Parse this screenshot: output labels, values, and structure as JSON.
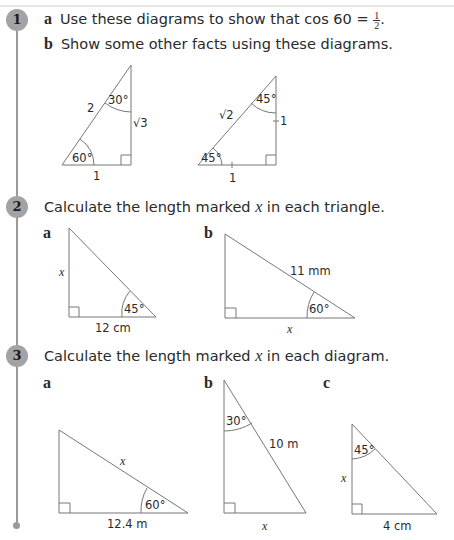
{
  "questions": [
    {
      "number": "1",
      "parts": [
        {
          "label": "a",
          "text": "Use these diagrams to show that cos 60 = ",
          "fraction": {
            "num": "1",
            "den": "2"
          },
          "suffix": "."
        },
        {
          "label": "b",
          "text": "Show some other facts using these diagrams."
        }
      ],
      "diagrams": [
        {
          "hyp": "2",
          "top_angle": "30°",
          "vertical": "√3",
          "bottom_angle": "60°",
          "base": "1"
        },
        {
          "hyp": "√2",
          "top_angle": "45°",
          "vertical": "1",
          "bottom_angle": "45°",
          "base": "1"
        }
      ]
    },
    {
      "number": "2",
      "prompt_pre": "Calculate the length marked ",
      "var": "x",
      "prompt_post": " in each triangle.",
      "diagrams": [
        {
          "label": "a",
          "vertical": "x",
          "angle": "45°",
          "base": "12 cm"
        },
        {
          "label": "b",
          "hyp": "11 mm",
          "angle": "60°",
          "base": "x"
        }
      ]
    },
    {
      "number": "3",
      "prompt_pre": "Calculate the length marked ",
      "var": "x",
      "prompt_post": " in each diagram.",
      "diagrams": [
        {
          "label": "a",
          "hyp": "x",
          "angle": "60°",
          "base": "12.4 m"
        },
        {
          "label": "b",
          "angle": "30°",
          "hyp": "10 m",
          "base": "x"
        },
        {
          "label": "c",
          "angle": "45°",
          "vertical": "x",
          "base": "4 cm"
        }
      ]
    }
  ]
}
